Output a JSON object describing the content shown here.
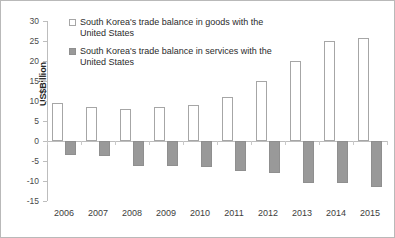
{
  "chart_data": {
    "type": "bar",
    "title": "",
    "xlabel": "",
    "ylabel": "US$Billion",
    "ylim": [
      -15,
      30
    ],
    "ytick_step": 5,
    "grid": false,
    "legend_position": "top-left-inside",
    "categories": [
      "2006",
      "2007",
      "2008",
      "2009",
      "2010",
      "2011",
      "2012",
      "2013",
      "2014",
      "2015"
    ],
    "series": [
      {
        "name": "South Korea's trade balance in goods with the United States",
        "marker_style": "open-square",
        "color": "#ffffff",
        "border_color": "#a6a6a6",
        "values": [
          9.5,
          8.5,
          8.0,
          8.5,
          9.0,
          11.0,
          15.0,
          20.0,
          25.0,
          25.8
        ]
      },
      {
        "name": "South Korea's trade balance in services with the United States",
        "marker_style": "filled-square",
        "color": "#999999",
        "border_color": "#8f8f8f",
        "values": [
          -3.5,
          -3.8,
          -6.3,
          -6.3,
          -6.5,
          -7.5,
          -8.0,
          -10.5,
          -10.5,
          -11.5
        ]
      }
    ],
    "ytick_labels": [
      "30",
      "25",
      "20",
      "15",
      "10",
      "5",
      "0",
      "-5",
      "-10",
      "-15"
    ],
    "legend": [
      {
        "label_line1": "South Korea's trade balance in goods",
        "label_line2": "with the United States",
        "swatch": "open-square-swatch"
      },
      {
        "label_line1": "South Korea's trade balance in",
        "label_line2": "services with the United States",
        "swatch": "filled-square-swatch"
      }
    ]
  }
}
